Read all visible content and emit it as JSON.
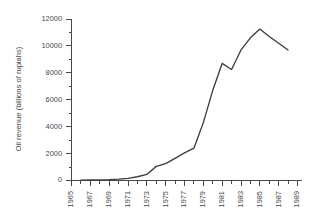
{
  "chart_data": {
    "type": "line",
    "title": "",
    "subtitle": "",
    "xlabel": "",
    "ylabel": "Oil revenue (billions of rupiahs)",
    "xlim": [
      1965,
      1989
    ],
    "ylim": [
      0,
      12000
    ],
    "yticks": [
      0,
      2000,
      4000,
      6000,
      8000,
      10000,
      12000
    ],
    "ytick_labels": [
      "0",
      "2000",
      "4000",
      "6000",
      "8000",
      "10000",
      "12000"
    ],
    "xticks": [
      1965,
      1967,
      1969,
      1971,
      1973,
      1975,
      1977,
      1979,
      1981,
      1983,
      1985,
      1987,
      1989
    ],
    "xtick_labels": [
      "1965",
      "1967",
      "1969",
      "1971",
      "1973",
      "1975",
      "1977",
      "1979",
      "1981",
      "1983",
      "1985",
      "1987",
      "1989"
    ],
    "xtick_minor": [
      1966,
      1968,
      1970,
      1972,
      1974,
      1976,
      1978,
      1980,
      1982,
      1984,
      1986,
      1988
    ],
    "grid": false,
    "legend": false,
    "legend_position": "none",
    "line_color": "#3c3c3c",
    "axis_color": "#4a4a4a",
    "background_color": "#ffffff",
    "series": [
      {
        "name": "Oil revenue",
        "x": [
          1966,
          1967,
          1968,
          1969,
          1970,
          1971,
          1972,
          1973,
          1974,
          1975,
          1976,
          1977,
          1978,
          1979,
          1980,
          1981,
          1982,
          1983,
          1984,
          1985,
          1986,
          1987,
          1988
        ],
        "values": [
          30,
          40,
          50,
          65,
          100,
          160,
          280,
          450,
          1050,
          1250,
          1650,
          2050,
          2400,
          4300,
          6700,
          8700,
          8250,
          9700,
          10600,
          11250,
          10700,
          10200,
          9700
        ]
      }
    ]
  },
  "axes": {
    "ylabel_text": "Oil revenue (billions of rupiahs)"
  }
}
